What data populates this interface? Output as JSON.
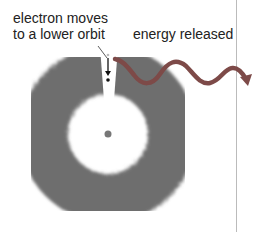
{
  "diagram": {
    "labels": {
      "electron_line1": "electron moves",
      "electron_line2": "to a lower orbit",
      "energy": "energy released"
    },
    "colors": {
      "cloud": "#6e6e6e",
      "wave": "#7d4a48",
      "arrow": "#111111",
      "nucleus": "#777777",
      "divider": "#bbbbbb"
    }
  }
}
